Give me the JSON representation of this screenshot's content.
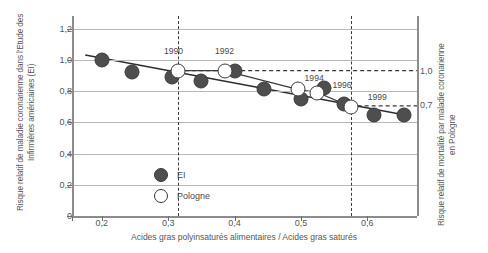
{
  "chart_data": {
    "type": "scatter",
    "title": "",
    "xlabel": "Acides gras polyinsaturés alimentaires / Acides gras saturés",
    "ylabel": "Risque relatif de maladie coronarienne dans l'Etude des Infirmières américaines (EI)",
    "ylabel_right": "Risque relatif de mortalité par maladie coronarienne en Pologne",
    "xlim": [
      0.155,
      0.675
    ],
    "ylim": [
      0,
      1.28
    ],
    "xticks": [
      0.2,
      0.3,
      0.4,
      0.5,
      0.6
    ],
    "xticklabels": [
      "0,2",
      "0,3",
      "0,4",
      "0,5",
      "0,6"
    ],
    "yticks": [
      0,
      0.2,
      0.4,
      0.6,
      0.8,
      1.0,
      1.2
    ],
    "yticklabels": [
      "0",
      "0,2",
      "0,4",
      "0,6",
      "0,8",
      "1,0",
      "1,2"
    ],
    "right_axis_ticks": [
      {
        "value": 0.93,
        "label": "1,0"
      },
      {
        "value": 0.71,
        "label": "0,7"
      }
    ],
    "grid": "horizontal",
    "legend_position": "inside-lower-left",
    "series": [
      {
        "name": "EI",
        "marker": "filled-circle",
        "color": "#4e4e4e",
        "points": [
          {
            "x": 0.2,
            "y": 1.0
          },
          {
            "x": 0.245,
            "y": 0.92
          },
          {
            "x": 0.305,
            "y": 0.89
          },
          {
            "x": 0.35,
            "y": 0.865
          },
          {
            "x": 0.4,
            "y": 0.93
          },
          {
            "x": 0.445,
            "y": 0.81
          },
          {
            "x": 0.5,
            "y": 0.75
          },
          {
            "x": 0.535,
            "y": 0.82
          },
          {
            "x": 0.565,
            "y": 0.72
          },
          {
            "x": 0.61,
            "y": 0.645
          },
          {
            "x": 0.655,
            "y": 0.645
          }
        ]
      },
      {
        "name": "Pologne",
        "marker": "open-circle",
        "color": "#ffffff",
        "points": [
          {
            "x": 0.315,
            "y": 0.93,
            "label": "1990"
          },
          {
            "x": 0.385,
            "y": 0.93,
            "label": "1992"
          },
          {
            "x": 0.495,
            "y": 0.81,
            "label": "1994"
          },
          {
            "x": 0.525,
            "y": 0.79,
            "label": "1996"
          },
          {
            "x": 0.575,
            "y": 0.7,
            "label": "1999"
          }
        ]
      }
    ],
    "trendline": {
      "x0": 0.175,
      "y0": 1.03,
      "x1": 0.665,
      "y1": 0.64
    },
    "pologne_connector": [
      {
        "x": 0.315,
        "y": 0.93
      },
      {
        "x": 0.385,
        "y": 0.93
      },
      {
        "x": 0.495,
        "y": 0.81
      },
      {
        "x": 0.525,
        "y": 0.79
      },
      {
        "x": 0.575,
        "y": 0.7
      }
    ],
    "reference_lines_h": [
      {
        "value": 0.93,
        "style": "dashed",
        "from_x": 0.315
      },
      {
        "value": 0.705,
        "style": "dashed",
        "from_x": 0.575
      }
    ],
    "reference_lines_v": [
      {
        "value": 0.315,
        "style": "dashed"
      },
      {
        "value": 0.575,
        "style": "dashed"
      }
    ],
    "year_labels": [
      {
        "text": "1990",
        "x": 0.308,
        "y": 1.055
      },
      {
        "text": "1992",
        "x": 0.385,
        "y": 1.055
      },
      {
        "text": "1994",
        "x": 0.52,
        "y": 0.885
      },
      {
        "text": "1996",
        "x": 0.562,
        "y": 0.838
      },
      {
        "text": "1999",
        "x": 0.615,
        "y": 0.76
      }
    ],
    "legend_entries": [
      {
        "label": "EI",
        "marker": "filled-circle"
      },
      {
        "label": "Pologne",
        "marker": "open-circle"
      }
    ]
  }
}
